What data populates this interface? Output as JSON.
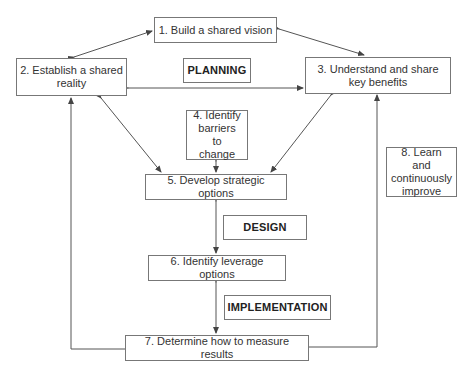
{
  "diagram": {
    "steps": [
      {
        "id": 1,
        "label": "1. Build a shared vision"
      },
      {
        "id": 2,
        "label": "2. Establish a shared reality"
      },
      {
        "id": 3,
        "label": "3. Understand and share key benefits"
      },
      {
        "id": 4,
        "label": "4. Identify barriers to change"
      },
      {
        "id": 5,
        "label": "5. Develop strategic options"
      },
      {
        "id": 6,
        "label": "6. Identify leverage options"
      },
      {
        "id": 7,
        "label": "7. Determine how to measure results"
      },
      {
        "id": 8,
        "label": "8. Learn and continuously improve"
      }
    ],
    "phases": {
      "planning": "PLANNING",
      "design": "DESIGN",
      "implementation": "IMPLEMENTATION"
    },
    "colors": {
      "line": "#555555",
      "border": "#777777",
      "text": "#333333",
      "background": "#ffffff"
    }
  }
}
